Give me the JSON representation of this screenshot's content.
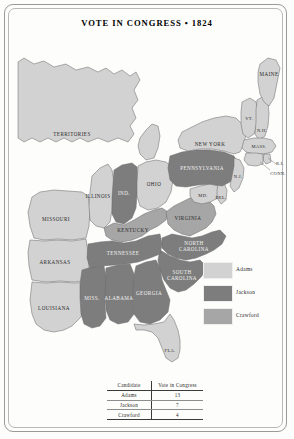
{
  "title": "VOTE IN CONGRESS • 1824",
  "colors": {
    "adams": "#d2d2d2",
    "jackson": "#7d7d7d",
    "crawford": "#a6a6a6",
    "water": "#ffffff",
    "outline": "#6e6e6e",
    "paper": "#fdfdfc"
  },
  "legend": {
    "items": [
      {
        "label": "Adams",
        "color": "#d2d2d2"
      },
      {
        "label": "Jackson",
        "color": "#7d7d7d"
      },
      {
        "label": "Crawford",
        "color": "#a6a6a6"
      }
    ]
  },
  "table": {
    "headers": [
      "Candidate",
      "Vote in Congress"
    ],
    "rows": [
      {
        "candidate": "Adams",
        "votes": "13"
      },
      {
        "candidate": "Jackson",
        "votes": "7"
      },
      {
        "candidate": "Crawford",
        "votes": "4"
      }
    ]
  },
  "map": {
    "regions": [
      {
        "name": "TERRITORIES",
        "vote": "none",
        "x": 62,
        "y": 100
      },
      {
        "name": "MISSOURI",
        "vote": "adams",
        "x": 46,
        "y": 185
      },
      {
        "name": "ILLINOIS",
        "vote": "adams",
        "x": 80,
        "y": 162
      },
      {
        "name": "IND.",
        "vote": "jackson",
        "x": 113,
        "y": 159
      },
      {
        "name": "OHIO",
        "vote": "adams",
        "x": 144,
        "y": 152
      },
      {
        "name": "KENTUCKY",
        "vote": "crawford",
        "x": 119,
        "y": 196
      },
      {
        "name": "TENNESSEE",
        "vote": "jackson",
        "x": 110,
        "y": 222
      },
      {
        "name": "ARKANSAS",
        "vote": "none",
        "x": 39,
        "y": 233
      },
      {
        "name": "LOUISIANA",
        "vote": "none",
        "x": 39,
        "y": 289
      },
      {
        "name": "MISS.",
        "vote": "jackson",
        "x": 75,
        "y": 270
      },
      {
        "name": "ALABAMA",
        "vote": "jackson",
        "x": 108,
        "y": 272
      },
      {
        "name": "GEORGIA",
        "vote": "jackson",
        "x": 145,
        "y": 265
      },
      {
        "name": "FLA.",
        "vote": "none",
        "x": 165,
        "y": 323
      },
      {
        "name": "SOUTH CAROLINA",
        "vote": "jackson",
        "x": 177,
        "y": 245
      },
      {
        "name": "NORTH CAROLINA",
        "vote": "jackson",
        "x": 186,
        "y": 219
      },
      {
        "name": "VIRGINIA",
        "vote": "crawford",
        "x": 176,
        "y": 182
      },
      {
        "name": "PENNSYLVANIA",
        "vote": "jackson",
        "x": 198,
        "y": 135
      },
      {
        "name": "MD.",
        "vote": "none",
        "x": 191,
        "y": 163
      },
      {
        "name": "DEL.",
        "vote": "none",
        "x": 206,
        "y": 165
      },
      {
        "name": "N.J.",
        "vote": "none",
        "x": 221,
        "y": 149
      },
      {
        "name": "NEW YORK",
        "vote": "adams",
        "x": 212,
        "y": 114
      },
      {
        "name": "VT.",
        "vote": "adams",
        "x": 239,
        "y": 89
      },
      {
        "name": "N.H.",
        "vote": "adams",
        "x": 249,
        "y": 99
      },
      {
        "name": "MAINE",
        "vote": "adams",
        "x": 259,
        "y": 63
      },
      {
        "name": "MASS.",
        "vote": "adams",
        "x": 249,
        "y": 117
      },
      {
        "name": "R.I.",
        "vote": "adams",
        "x": 264,
        "y": 128
      },
      {
        "name": "CONN.",
        "vote": "adams",
        "x": 263,
        "y": 138
      }
    ]
  }
}
